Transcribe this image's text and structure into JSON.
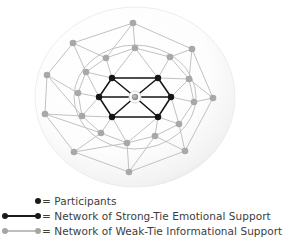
{
  "figure": {
    "title": "",
    "sphere": {
      "center_x": 135,
      "center_y": 97,
      "radius_x": 100,
      "radius_y": 90,
      "fill_color": "#fbfbfb",
      "edge_color": "#e3e3e3"
    },
    "colors": {
      "participant_node": "#151515",
      "strong_tie_edge": "#151515",
      "weak_tie_node": "#a8a8a8",
      "weak_tie_edge": "#c2c2c2",
      "center_node": "#9a9a9a",
      "center_halo": "#ffffff",
      "background": "#ffffff",
      "text": "#3d3d3d"
    },
    "center_node": {
      "id": "ego",
      "x": 135,
      "y": 97,
      "r": 3.2,
      "halo_r": 6.0
    },
    "inner_ring_label": "Network of Strong-Tie Emotional Support",
    "inner_nodes": [
      {
        "id": "s1",
        "x": 112,
        "y": 78
      },
      {
        "id": "s2",
        "x": 158,
        "y": 78
      },
      {
        "id": "s3",
        "x": 171,
        "y": 97
      },
      {
        "id": "s4",
        "x": 158,
        "y": 117
      },
      {
        "id": "s5",
        "x": 112,
        "y": 117
      },
      {
        "id": "s6",
        "x": 99,
        "y": 97
      }
    ],
    "inner_edges": [
      [
        "s1",
        "s2"
      ],
      [
        "s2",
        "s3"
      ],
      [
        "s3",
        "s4"
      ],
      [
        "s4",
        "s5"
      ],
      [
        "s5",
        "s6"
      ],
      [
        "s6",
        "s1"
      ],
      [
        "ego",
        "s1"
      ],
      [
        "ego",
        "s2"
      ],
      [
        "ego",
        "s3"
      ],
      [
        "ego",
        "s4"
      ],
      [
        "ego",
        "s5"
      ],
      [
        "ego",
        "s6"
      ]
    ],
    "middle_ring_label": "Network of Weak-Tie Informational Support",
    "middle_ring_circle": {
      "cx": 135,
      "cy": 97,
      "rx": 61,
      "ry": 52
    },
    "middle_nodes": [
      {
        "id": "m1",
        "x": 135,
        "y": 48
      },
      {
        "id": "m2",
        "x": 170,
        "y": 57
      },
      {
        "id": "m3",
        "x": 189,
        "y": 79
      },
      {
        "id": "m4",
        "x": 194,
        "y": 102
      },
      {
        "id": "m5",
        "x": 179,
        "y": 124
      },
      {
        "id": "m6",
        "x": 155,
        "y": 136
      },
      {
        "id": "m7",
        "x": 127,
        "y": 143
      },
      {
        "id": "m8",
        "x": 101,
        "y": 133
      },
      {
        "id": "m9",
        "x": 82,
        "y": 116
      },
      {
        "id": "m10",
        "x": 78,
        "y": 93
      },
      {
        "id": "m11",
        "x": 86,
        "y": 72
      },
      {
        "id": "m12",
        "x": 106,
        "y": 58
      }
    ],
    "middle_edges": [
      [
        "m1",
        "m2"
      ],
      [
        "m2",
        "m3"
      ],
      [
        "m3",
        "m4"
      ],
      [
        "m4",
        "m5"
      ],
      [
        "m5",
        "m6"
      ],
      [
        "m6",
        "m7"
      ],
      [
        "m7",
        "m8"
      ],
      [
        "m8",
        "m9"
      ],
      [
        "m9",
        "m10"
      ],
      [
        "m10",
        "m11"
      ],
      [
        "m11",
        "m12"
      ],
      [
        "m12",
        "m1"
      ],
      [
        "m1",
        "s1"
      ],
      [
        "m1",
        "s2"
      ],
      [
        "m2",
        "s2"
      ],
      [
        "m3",
        "s2"
      ],
      [
        "m3",
        "s3"
      ],
      [
        "m4",
        "s3"
      ],
      [
        "m5",
        "s3"
      ],
      [
        "m5",
        "s4"
      ],
      [
        "m6",
        "s4"
      ],
      [
        "m7",
        "s4"
      ],
      [
        "m7",
        "s5"
      ],
      [
        "m8",
        "s5"
      ],
      [
        "m9",
        "s5"
      ],
      [
        "m9",
        "s6"
      ],
      [
        "m10",
        "s6"
      ],
      [
        "m11",
        "s6"
      ],
      [
        "m11",
        "s1"
      ],
      [
        "m12",
        "s1"
      ]
    ],
    "outer_nodes": [
      {
        "id": "o1",
        "x": 133,
        "y": 23
      },
      {
        "id": "o2",
        "x": 192,
        "y": 49
      },
      {
        "id": "o3",
        "x": 213,
        "y": 98
      },
      {
        "id": "o4",
        "x": 185,
        "y": 151
      },
      {
        "id": "o5",
        "x": 129,
        "y": 172
      },
      {
        "id": "o6",
        "x": 74,
        "y": 152
      },
      {
        "id": "o7",
        "x": 45,
        "y": 114
      },
      {
        "id": "o8",
        "x": 47,
        "y": 75
      },
      {
        "id": "o9",
        "x": 73,
        "y": 43
      }
    ],
    "outer_edges": [
      [
        "o1",
        "o2"
      ],
      [
        "o2",
        "o3"
      ],
      [
        "o3",
        "o4"
      ],
      [
        "o4",
        "o5"
      ],
      [
        "o5",
        "o6"
      ],
      [
        "o6",
        "o7"
      ],
      [
        "o7",
        "o8"
      ],
      [
        "o8",
        "o9"
      ],
      [
        "o9",
        "o1"
      ],
      [
        "o1",
        "m1"
      ],
      [
        "o1",
        "m12"
      ],
      [
        "o2",
        "m2"
      ],
      [
        "o2",
        "m3"
      ],
      [
        "o3",
        "m3"
      ],
      [
        "o3",
        "m4"
      ],
      [
        "o4",
        "m5"
      ],
      [
        "o4",
        "m6"
      ],
      [
        "o5",
        "m6"
      ],
      [
        "o5",
        "m7"
      ],
      [
        "o6",
        "m7"
      ],
      [
        "o6",
        "m8"
      ],
      [
        "o7",
        "m9"
      ],
      [
        "o7",
        "m8"
      ],
      [
        "o8",
        "m10"
      ],
      [
        "o8",
        "m9"
      ],
      [
        "o9",
        "m11"
      ],
      [
        "o9",
        "m12"
      ]
    ]
  },
  "legend": {
    "rows": [
      {
        "marker": "single-dot-black",
        "label": "= Participants",
        "dot_color": "#1a1a1a",
        "line_color": null
      },
      {
        "marker": "dot-line-dot-black",
        "label": "= Network of Strong-Tie Emotional Support",
        "dot_color": "#1a1a1a",
        "line_color": "#1a1a1a"
      },
      {
        "marker": "dot-line-dot-gray",
        "label": "= Network of Weak-Tie Informational Support",
        "dot_color": "#a6a6a6",
        "line_color": "#c2c2c2"
      }
    ]
  }
}
